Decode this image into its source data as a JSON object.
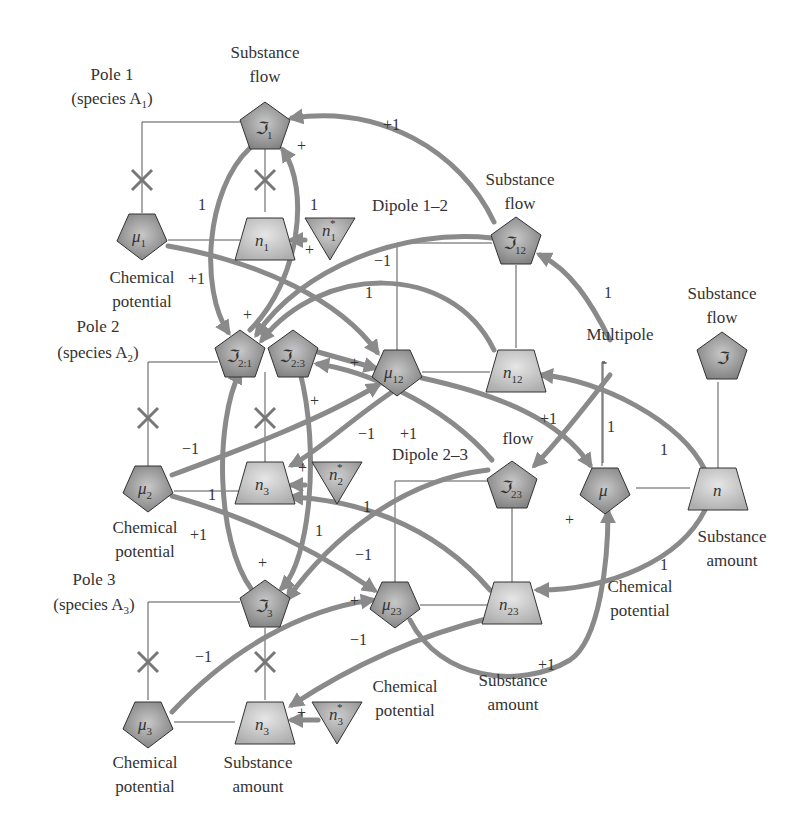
{
  "diagram": {
    "colors": {
      "pentagon_fill": "#8d8d8d",
      "trapezoid_fill": "#c4c4c4",
      "triangle_fill": "#a0a0a0",
      "arrow": "#8a8a8a",
      "line": "#555555",
      "text": "#333333"
    },
    "group_labels": {
      "pole1": [
        "Pole 1",
        "(species A",
        "1",
        ")"
      ],
      "pole2": [
        "Pole 2",
        "(species A",
        "2",
        ")"
      ],
      "pole3": [
        "Pole 3",
        "(species A",
        "3",
        ")"
      ],
      "dipole12": "Dipole 1–2",
      "dipole23": "Dipole 2–3",
      "multipole": "Multipole"
    },
    "captions": {
      "substance_flow_1": [
        "Substance",
        "flow"
      ],
      "substance_flow_12": [
        "Substance",
        "flow"
      ],
      "substance_flow_multi": [
        "Substance",
        "flow"
      ],
      "flow_23": "flow",
      "chem_pot_1": [
        "Chemical",
        "potential"
      ],
      "chem_pot_2": [
        "Chemical",
        "potential"
      ],
      "chem_pot_3": [
        "Chemical",
        "potential"
      ],
      "chem_pot_23": [
        "Chemical",
        "potential"
      ],
      "chem_pot_multi": [
        "Chemical",
        "potential"
      ],
      "subst_amount_3": [
        "Substance",
        "amount"
      ],
      "subst_amount_23": [
        "Substance",
        "amount"
      ],
      "subst_amount_multi": [
        "Substance",
        "amount"
      ]
    },
    "nodes": {
      "J1": {
        "main": "ℑ",
        "sub": "1",
        "shape": "pentagon"
      },
      "mu1": {
        "main": "μ",
        "sub": "1",
        "shape": "pentagon"
      },
      "n1": {
        "main": "n",
        "sub": "1",
        "shape": "trapezoid"
      },
      "n1star": {
        "main": "n",
        "sub": "1",
        "sup": "*",
        "shape": "triangle"
      },
      "J12": {
        "main": "ℑ",
        "sub": "12",
        "shape": "pentagon"
      },
      "mu12": {
        "main": "μ",
        "sub": "12",
        "shape": "pentagon"
      },
      "n12": {
        "main": "n",
        "sub": "12",
        "shape": "trapezoid"
      },
      "J21": {
        "main": "ℑ",
        "sub": "2:1",
        "shape": "pentagon"
      },
      "J23a": {
        "main": "ℑ",
        "sub": "2:3",
        "shape": "pentagon"
      },
      "mu2": {
        "main": "μ",
        "sub": "2",
        "shape": "pentagon"
      },
      "n3_pole2": {
        "main": "n",
        "sub": "3",
        "shape": "trapezoid"
      },
      "n2star": {
        "main": "n",
        "sub": "2",
        "sup": "*",
        "shape": "triangle"
      },
      "J": {
        "main": "ℑ",
        "sub": "",
        "shape": "pentagon"
      },
      "mu": {
        "main": "μ",
        "sub": "",
        "shape": "pentagon"
      },
      "n": {
        "main": "n",
        "sub": "",
        "shape": "trapezoid"
      },
      "J23": {
        "main": "ℑ",
        "sub": "23",
        "shape": "pentagon"
      },
      "mu23": {
        "main": "μ",
        "sub": "23",
        "shape": "pentagon"
      },
      "n23": {
        "main": "n",
        "sub": "23",
        "shape": "trapezoid"
      },
      "J3": {
        "main": "ℑ",
        "sub": "3",
        "shape": "pentagon"
      },
      "mu3": {
        "main": "μ",
        "sub": "3",
        "shape": "pentagon"
      },
      "n3": {
        "main": "n",
        "sub": "3",
        "shape": "trapezoid"
      },
      "n3star": {
        "main": "n",
        "sub": "3",
        "sup": "*",
        "shape": "triangle"
      }
    },
    "coefficients": {
      "c_plus1_top": "+1",
      "c_1_left_loop1": "1",
      "c_1_right_loop1": "1",
      "c_plus_J1": "+",
      "c_plus_n1": "+",
      "c_minus1_d12": "−1",
      "c_1_d12": "1",
      "c_plus1_mu1": "+1",
      "c_1_J12": "1",
      "c_plus_J21": "+",
      "c_plus_mu12": "+",
      "c_plus_J23a": "+",
      "c_plus1_mu": "+1",
      "c_minus1_mu2": "−1",
      "c_1_mu2": "1",
      "c_plus1_mu2": "+1",
      "c_minus1_mid": "−1",
      "c_plus1_mid": "+1",
      "c_plus_n3p2": "+",
      "c_1_n3_right": "1",
      "c_1_loop2": "1",
      "c_minus1_J23": "−1",
      "c_1_multi_left": "1",
      "c_1_multi_mid": "1",
      "c_plus_mu": "+",
      "c_1_chem_multi": "1",
      "c_plus_J3": "+",
      "c_plus_mu23": "+",
      "c_minus1_mu23": "−1",
      "c_minus1_mu3": "−1",
      "c_plus1_n23": "+1",
      "c_plus_n3": "+"
    }
  }
}
